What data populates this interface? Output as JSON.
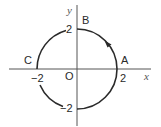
{
  "diagram": {
    "type": "circle-on-axes",
    "axes": {
      "x_label": "x",
      "y_label": "y",
      "origin_label": "O"
    },
    "ticks": {
      "x_pos": "2",
      "x_neg": "−2",
      "y_pos": "2",
      "y_neg": "−2"
    },
    "points": {
      "A": "A",
      "B": "B",
      "C": "C"
    },
    "circle": {
      "center": [
        0,
        0
      ],
      "radius": 2,
      "direction": "counter-clockwise",
      "arrow_on_arc": "A-to-B"
    },
    "colors": {
      "stroke": "#2a2a2a",
      "axis": "#555555"
    }
  }
}
